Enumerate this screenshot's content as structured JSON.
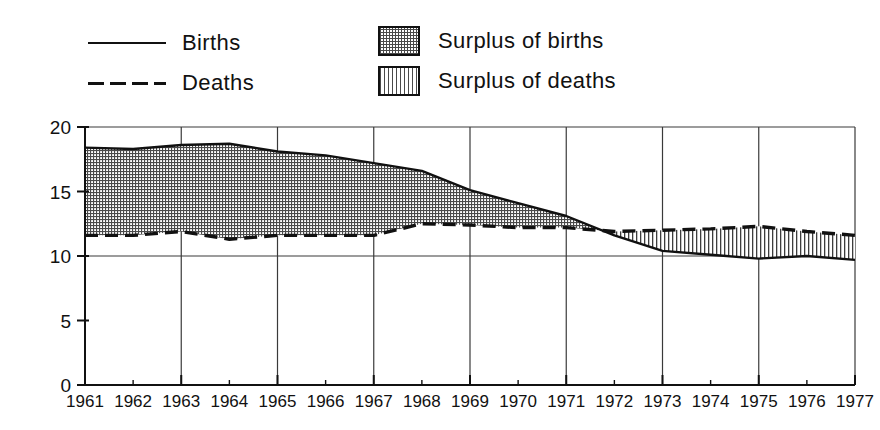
{
  "legend": {
    "items": [
      {
        "id": "births-line",
        "label": "Births",
        "marker": "solid-line"
      },
      {
        "id": "deaths-line",
        "label": "Deaths",
        "marker": "dashed-line"
      },
      {
        "id": "surplus-births",
        "label": "Surplus of births",
        "marker": "dotted-fill-swatch"
      },
      {
        "id": "surplus-deaths",
        "label": "Surplus of deaths",
        "marker": "vertical-hatch-swatch"
      }
    ]
  },
  "colors": {
    "ink": "#111111",
    "grid": "#3a3a3a",
    "hatch": "#4a4a4a",
    "background": "#ffffff"
  },
  "chart_data": {
    "type": "line",
    "title": "",
    "xlabel": "",
    "ylabel": "",
    "xlim": [
      1961,
      1977
    ],
    "ylim": [
      0,
      20
    ],
    "yticks": [
      0,
      5,
      10,
      15,
      20
    ],
    "ytick_labels": [
      "0",
      "5",
      "10",
      "15",
      "20"
    ],
    "grid": "vertical gridlines at odd years; horizontal gridlines at 10 and 20",
    "gridline_years": [
      1961,
      1963,
      1965,
      1967,
      1969,
      1971,
      1973,
      1975,
      1977
    ],
    "gridline_y": [
      10,
      20
    ],
    "legend_position": "above-plot",
    "categories": [
      1961,
      1962,
      1963,
      1964,
      1965,
      1966,
      1967,
      1968,
      1969,
      1970,
      1971,
      1972,
      1973,
      1974,
      1975,
      1976,
      1977
    ],
    "xtick_labels": [
      "1961",
      "1962",
      "1963",
      "1964",
      "1965",
      "1966",
      "1967",
      "1968",
      "1969",
      "1970",
      "1971",
      "1972",
      "1973",
      "1974",
      "1975",
      "1976",
      "1977"
    ],
    "series": [
      {
        "name": "Births",
        "style": "solid",
        "values": [
          18.4,
          18.3,
          18.6,
          18.7,
          18.1,
          17.8,
          17.2,
          16.6,
          15.1,
          14.1,
          13.1,
          11.6,
          10.4,
          10.1,
          9.8,
          10.0,
          9.7
        ]
      },
      {
        "name": "Deaths",
        "style": "dashed",
        "values": [
          11.6,
          11.6,
          11.9,
          11.3,
          11.6,
          11.6,
          11.6,
          12.5,
          12.4,
          12.2,
          12.2,
          11.9,
          12.0,
          12.1,
          12.3,
          11.9,
          11.6
        ]
      }
    ],
    "fills": [
      {
        "name": "Surplus of births",
        "between": [
          "Births",
          "Deaths"
        ],
        "when": "Births > Deaths",
        "pattern": "dotted"
      },
      {
        "name": "Surplus of deaths",
        "between": [
          "Deaths",
          "Births"
        ],
        "when": "Deaths > Births",
        "pattern": "vertical-lines"
      }
    ]
  }
}
